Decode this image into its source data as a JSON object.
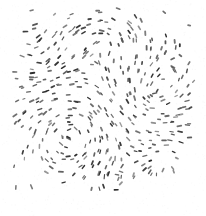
{
  "figure": {
    "kind": "vector-field-glyph-plot",
    "title": "",
    "subtitle": "",
    "has_axes": false,
    "has_legend": false,
    "has_gridlines": false,
    "has_text_labels": false,
    "width_px": 206,
    "height_px": 216,
    "background_color": "#ffffff"
  },
  "chart_data": {
    "type": "scatter",
    "title": "",
    "xlabel": "",
    "ylabel": "",
    "legend": [],
    "grid": false,
    "legend_position": "none",
    "glyph": {
      "shape": "short-line-segment",
      "description": "small dark tick mark oriented tangent to the local flow direction",
      "length_px_min": 2.0,
      "length_px_max": 4.2,
      "thickness_px_min": 1.1,
      "thickness_px_max": 1.9,
      "color_dark": "#2b2b2b",
      "color_light": "#5e5e5e",
      "opacity_min": 0.62,
      "opacity_max": 1.0
    },
    "field_region": {
      "x_min": 14,
      "x_max": 196,
      "y_min": 8,
      "y_max": 191
    },
    "xlim": [
      14,
      196
    ],
    "ylim": [
      8,
      191
    ],
    "sample_count": 620,
    "jitter_px": 5.0,
    "grid_step_px": 7.4,
    "density_profile": {
      "description": "approximately uniform across the field region with mild random thinning",
      "keep_probability": 0.88,
      "edge_falloff": 0.12
    },
    "flow_model": {
      "description": "superposition of rotational vortices plus a gentle uniform drift; glyph angle equals local flow heading",
      "base_drift_angle_deg": 8,
      "base_drift_weight": 0.3,
      "vortices": [
        {
          "cx": 72,
          "cy": 132,
          "strength": 1.0,
          "radius": 62,
          "sense": "ccw"
        },
        {
          "cx": 150,
          "cy": 96,
          "strength": 0.74,
          "radius": 55,
          "sense": "cw"
        },
        {
          "cx": 104,
          "cy": 44,
          "strength": 0.52,
          "radius": 48,
          "sense": "ccw"
        },
        {
          "cx": 44,
          "cy": 62,
          "strength": 0.46,
          "radius": 42,
          "sense": "cw"
        },
        {
          "cx": 166,
          "cy": 166,
          "strength": 0.58,
          "radius": 46,
          "sense": "ccw"
        },
        {
          "cx": 112,
          "cy": 178,
          "strength": 0.4,
          "radius": 40,
          "sense": "cw"
        }
      ],
      "angle_noise_deg": 12
    },
    "random_seed": 20240517
  },
  "noise": {
    "description": "faint JPEG compression speckle over white background",
    "speckle_count": 900,
    "color": "#d8d8d8",
    "opacity": 0.3
  }
}
